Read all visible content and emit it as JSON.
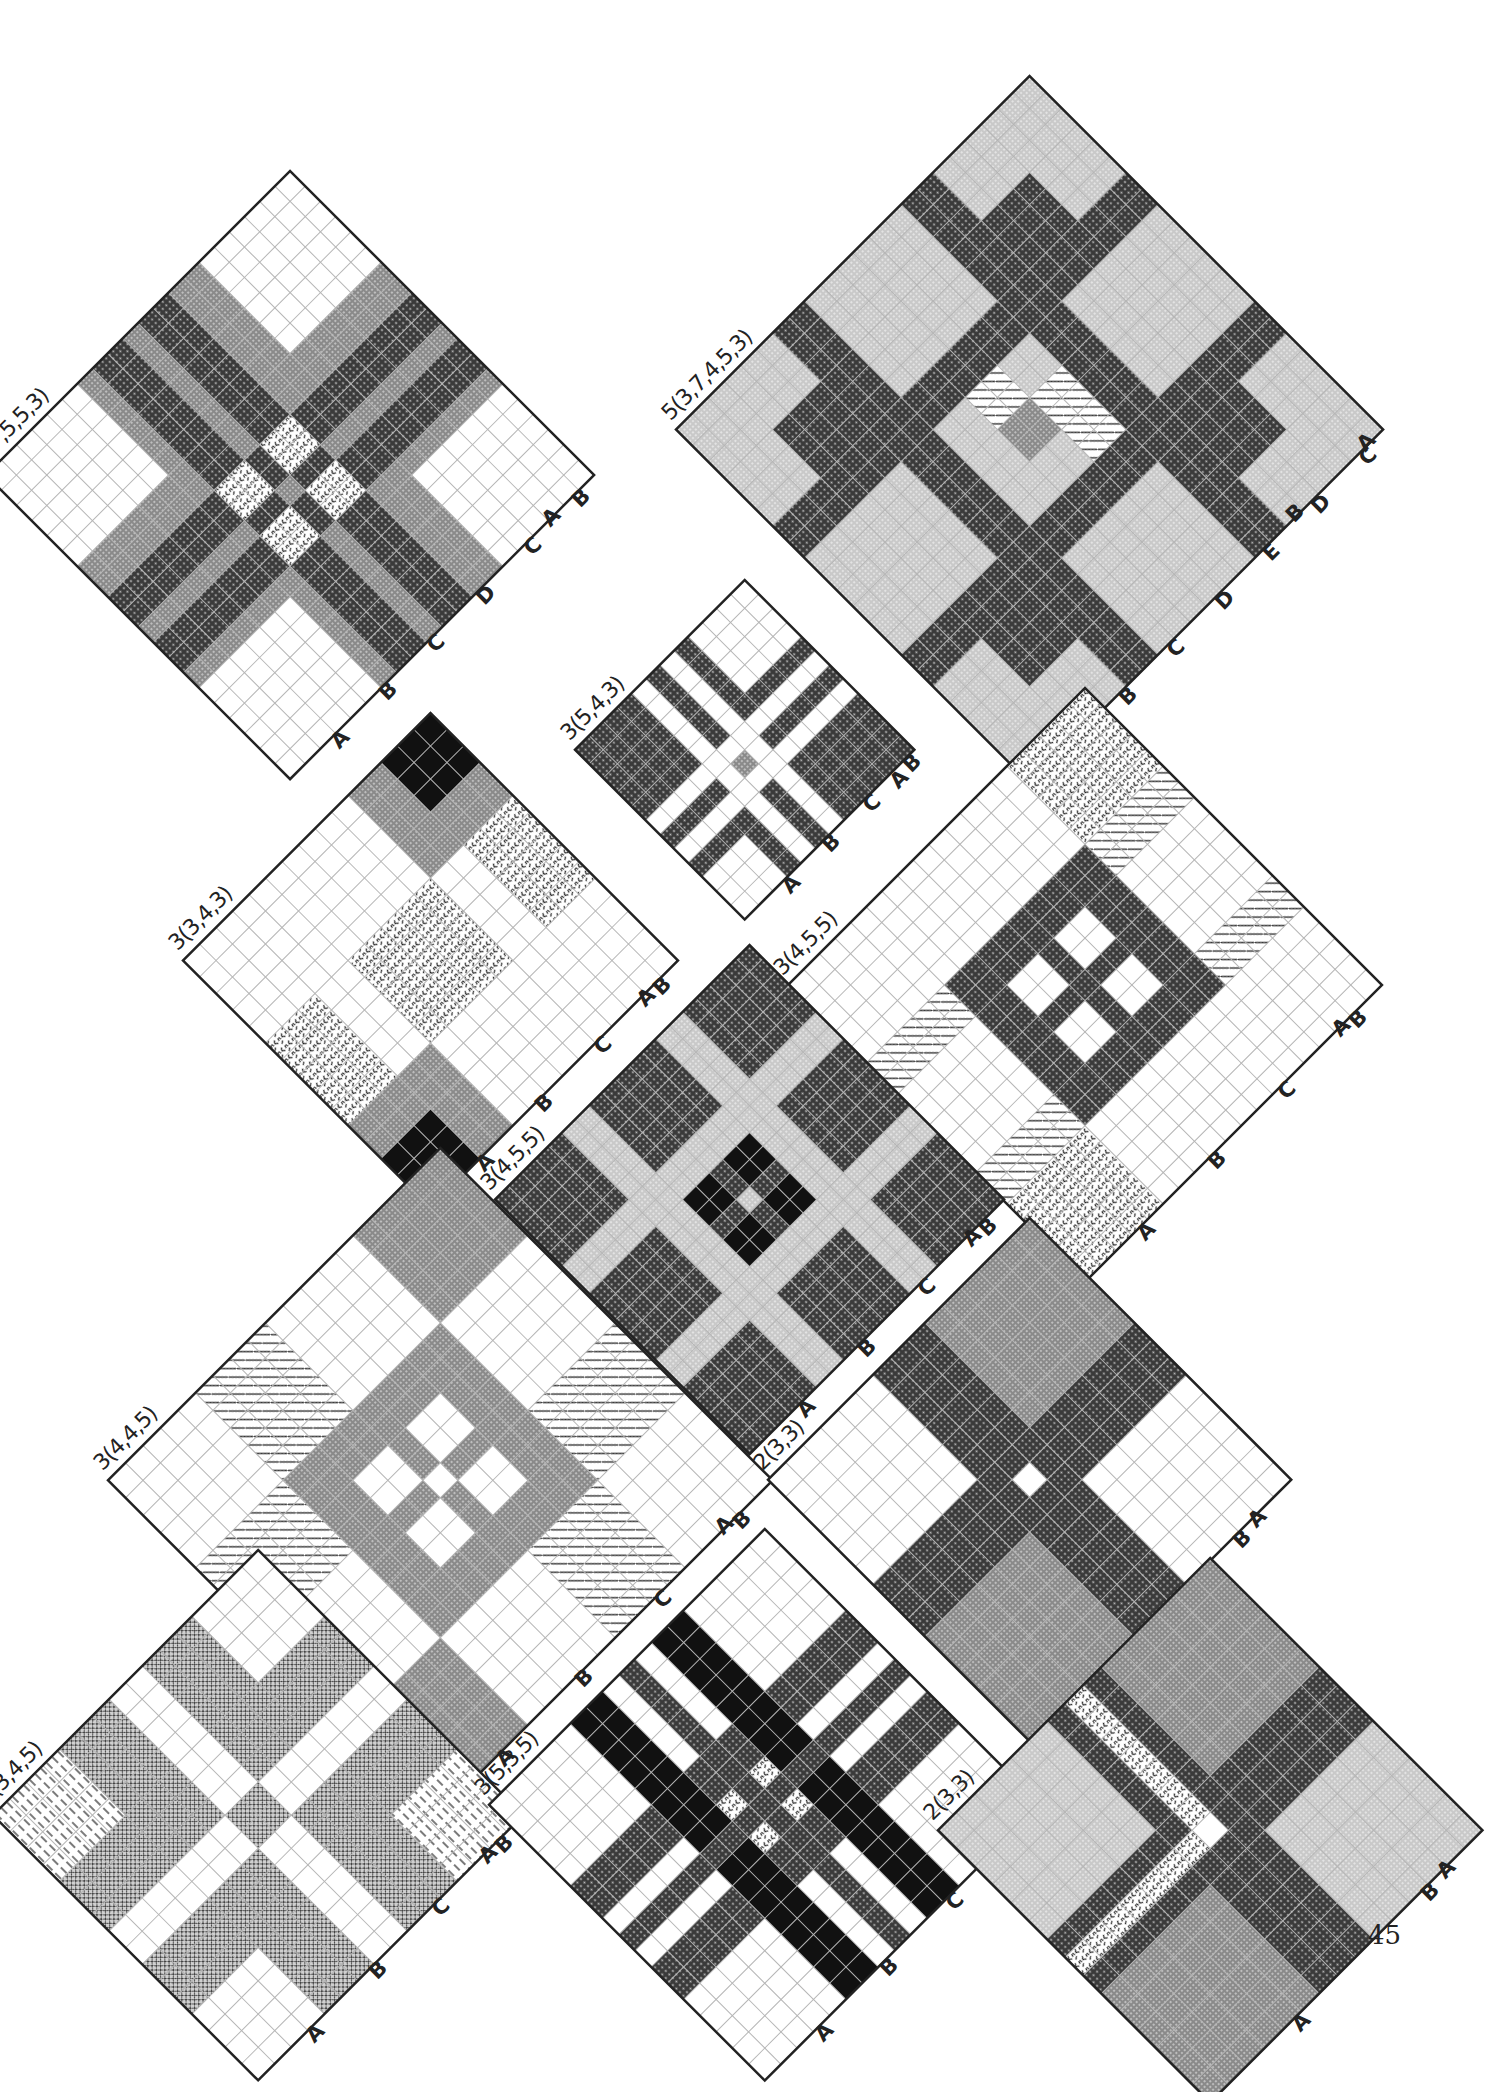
{
  "page": {
    "number": "45"
  },
  "colors": {
    "white": "#ffffff",
    "light": "#c9c9c9",
    "mid": "#8a8a8a",
    "dark": "#3a3a3a",
    "black": "#111111",
    "grid_light": "#b5b5b5",
    "grid_dark": "#222222"
  },
  "blocks": [
    {
      "id": "b1",
      "label": "4(7,5,5,3)",
      "edge_left": [
        "A",
        "B",
        "C",
        "D",
        "C",
        "B"
      ],
      "edge_right": [
        "A"
      ],
      "cx": 290,
      "cy": 475,
      "size": 430,
      "n": 20,
      "bands": [
        7,
        2,
        2,
        2,
        7
      ],
      "pattern": "cross4"
    },
    {
      "id": "b2",
      "label": "5(3,7,4,5,3)",
      "edge_left": [
        "A",
        "B",
        "C",
        "D",
        "E",
        "D",
        "C"
      ],
      "edge_right": [
        "B",
        "A"
      ],
      "cx": 1030,
      "cy": 430,
      "size": 500,
      "n": 22,
      "pattern": "cross5"
    },
    {
      "id": "b3",
      "label": "3(5,4,3)",
      "edge_left": [
        "A",
        "B",
        "C",
        "B"
      ],
      "edge_right": [
        "A"
      ],
      "cx": 745,
      "cy": 750,
      "size": 240,
      "n": 12,
      "pattern": "cross3a"
    },
    {
      "id": "b4",
      "label": "3(3,4,3)",
      "edge_left": [
        "A",
        "B",
        "C",
        "B"
      ],
      "edge_right": [
        "A"
      ],
      "cx": 430,
      "cy": 960,
      "size": 350,
      "n": 15,
      "pattern": "cross3b"
    },
    {
      "id": "b5",
      "label": "3(4,5,5)",
      "edge_left": [
        "A",
        "B",
        "C",
        "B"
      ],
      "edge_right": [
        "A"
      ],
      "cx": 1085,
      "cy": 985,
      "size": 420,
      "n": 19,
      "pattern": "cross3c"
    },
    {
      "id": "b6",
      "label": "3(4,5,5)",
      "edge_left": [
        "A",
        "B",
        "C",
        "B"
      ],
      "edge_right": [
        "A"
      ],
      "cx": 750,
      "cy": 1200,
      "size": 360,
      "n": 19,
      "pattern": "cross3d"
    },
    {
      "id": "b7",
      "label": "3(4,4,5)",
      "edge_left": [
        "A",
        "B",
        "C",
        "B"
      ],
      "edge_right": [
        "A"
      ],
      "cx": 440,
      "cy": 1480,
      "size": 470,
      "n": 19,
      "pattern": "cross3e"
    },
    {
      "id": "b8",
      "label": "2(3,3)",
      "edge_left": [
        "A",
        "B"
      ],
      "edge_right": [
        "A"
      ],
      "cx": 1030,
      "cy": 1480,
      "size": 370,
      "n": 15,
      "pattern": "cross2a"
    },
    {
      "id": "b9",
      "label": "3(3,4,5)",
      "edge_left": [
        "A",
        "B",
        "C",
        "B"
      ],
      "edge_right": [
        "A"
      ],
      "cx": 258,
      "cy": 1815,
      "size": 375,
      "n": 16,
      "pattern": "cross3f"
    },
    {
      "id": "b10",
      "label": "3(5,3,5)",
      "edge_left": [
        "A",
        "B",
        "C",
        "B"
      ],
      "edge_right": [
        "A"
      ],
      "cx": 765,
      "cy": 1805,
      "size": 390,
      "n": 17,
      "pattern": "cross3g"
    },
    {
      "id": "b11",
      "label": "2(3,3)",
      "edge_left": [
        "A",
        "B"
      ],
      "edge_right": [
        "A"
      ],
      "cx": 1210,
      "cy": 1830,
      "size": 385,
      "n": 15,
      "pattern": "cross2b"
    }
  ]
}
